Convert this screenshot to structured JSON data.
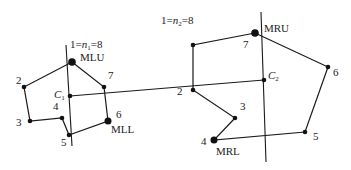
{
  "left_polygon": {
    "header": {
      "prefix": "1=",
      "n": "n",
      "sub": "1",
      "suffix": "=8"
    },
    "labels": {
      "mlu": "MLU",
      "mll": "MLL",
      "c": "C",
      "c_sub": "1",
      "p2": "2",
      "p3": "3",
      "p4": "4",
      "p5": "5",
      "p6": "6",
      "p7": "7"
    }
  },
  "right_polygon": {
    "header": {
      "prefix": "1=",
      "n": "n",
      "sub": "2",
      "suffix": "=8"
    },
    "labels": {
      "mru": "MRU",
      "mrl": "MRL",
      "c": "C",
      "c_sub": "2",
      "p2": "2",
      "p3": "3",
      "p4": "4",
      "p5": "5",
      "p6": "6",
      "p7": "7"
    }
  }
}
